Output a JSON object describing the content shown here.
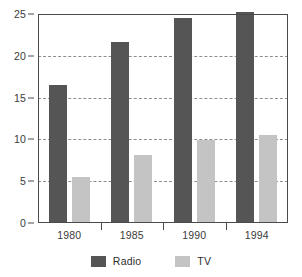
{
  "chart_data": {
    "type": "bar",
    "title": "",
    "subtitle": "",
    "xlabel": "",
    "ylabel": "",
    "categories": [
      "1980",
      "1985",
      "1990",
      "1994"
    ],
    "series": [
      {
        "name": "Radio",
        "color": "#555555",
        "values": [
          16.5,
          21.6,
          24.5,
          25.2
        ]
      },
      {
        "name": "TV",
        "color": "#c4c4c4",
        "values": [
          5.5,
          8.1,
          9.9,
          10.5
        ]
      }
    ],
    "ylim": [
      0,
      25
    ],
    "yticks": [
      0,
      5,
      10,
      15,
      20,
      25
    ],
    "ytick_labels": [
      "0",
      "5",
      "10",
      "15",
      "20",
      "25"
    ],
    "grid": true,
    "grid_axis": "y",
    "grid_style": "dashed",
    "grid_color": "#8d8d8d",
    "legend_position": "bottom",
    "axis_color": "#4a4a4a",
    "background": "#ffffff",
    "annotations": []
  },
  "legend": {
    "items": [
      {
        "label": "Radio",
        "swatch": "legend-swatch-radio"
      },
      {
        "label": "TV",
        "swatch": "legend-swatch-tv"
      }
    ]
  }
}
